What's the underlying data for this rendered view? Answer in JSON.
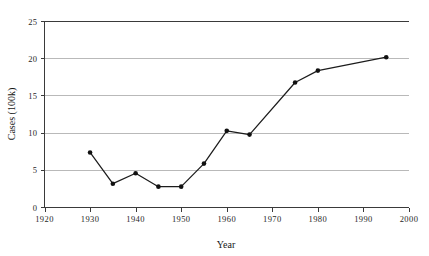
{
  "chart_data": {
    "type": "line",
    "title": "",
    "xlabel": "Year",
    "ylabel": "Cases (100k)",
    "xlim": [
      1920,
      2000
    ],
    "ylim": [
      0,
      25
    ],
    "grid": true,
    "legend": false,
    "xticks": [
      1920,
      1930,
      1940,
      1950,
      1960,
      1970,
      1980,
      1990,
      2000
    ],
    "xtick_labels": [
      "1920",
      "1930",
      "1940",
      "1950",
      "1960",
      "1970",
      "1980",
      "1990",
      "2000"
    ],
    "yticks": [
      0,
      5,
      10,
      15,
      20,
      25
    ],
    "ytick_labels": [
      "0",
      "5",
      "10",
      "15",
      "20",
      "25"
    ],
    "marker": "filled-circle",
    "line_color": "#1c1c1c",
    "marker_color": "#111111",
    "grid_color": "#b9b9b9",
    "axis_color": "#3a3a3a",
    "x": [
      1930,
      1935,
      1940,
      1945,
      1950,
      1955,
      1960,
      1965,
      1975,
      1980,
      1995
    ],
    "values": [
      7.4,
      3.2,
      4.6,
      2.8,
      2.8,
      5.9,
      10.3,
      9.8,
      16.8,
      18.4,
      20.2
    ],
    "points": [
      {
        "year": 1930,
        "cases": 7.4
      },
      {
        "year": 1935,
        "cases": 3.2
      },
      {
        "year": 1940,
        "cases": 4.6
      },
      {
        "year": 1945,
        "cases": 2.8
      },
      {
        "year": 1950,
        "cases": 2.8
      },
      {
        "year": 1955,
        "cases": 5.9
      },
      {
        "year": 1960,
        "cases": 10.3
      },
      {
        "year": 1965,
        "cases": 9.8
      },
      {
        "year": 1975,
        "cases": 16.8
      },
      {
        "year": 1980,
        "cases": 18.4
      },
      {
        "year": 1995,
        "cases": 20.2
      }
    ]
  }
}
